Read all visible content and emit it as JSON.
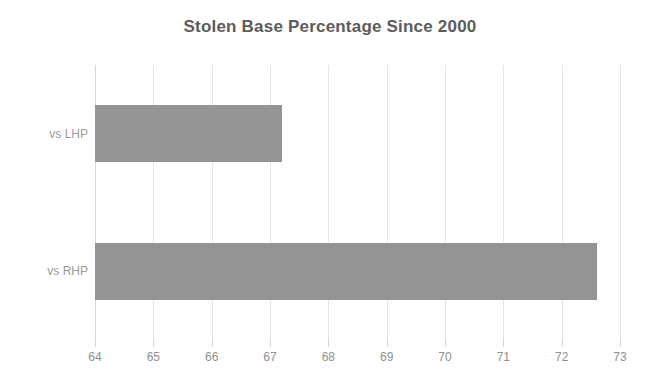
{
  "chart_data": {
    "type": "bar",
    "orientation": "horizontal",
    "title": "Stolen Base Percentage Since 2000",
    "xlabel": "",
    "ylabel": "",
    "categories": [
      "vs LHP",
      "vs RHP"
    ],
    "values": [
      67.2,
      72.6
    ],
    "xlim": [
      64,
      73
    ],
    "xticks": [
      64,
      65,
      66,
      67,
      68,
      69,
      70,
      71,
      72,
      73
    ],
    "xtick_labels": [
      "64",
      "65",
      "66",
      "67",
      "68",
      "69",
      "70",
      "71",
      "72",
      "73"
    ],
    "grid": "vertical",
    "legend": "none",
    "bar_color": "#949494",
    "title_color": "#5c5c5c",
    "gridline_color": "#e4e4e4",
    "tick_label_color": "#8f8f8f",
    "category_label_color": "#9a9a9a",
    "background_color": "#ffffff"
  }
}
